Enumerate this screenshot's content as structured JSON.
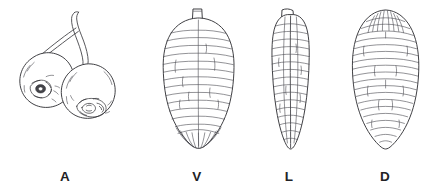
{
  "figure": {
    "type": "scientific-line-drawing-plate",
    "background_color": "#ffffff",
    "ink_color": "#3a3a3e",
    "width": 438,
    "height": 192,
    "panel_count": 4
  },
  "panels": [
    {
      "key": "A",
      "label": "A",
      "subject": "two cherries on joined stems with scale insect encrustations",
      "view": "habitus / host damage",
      "label_x": 65,
      "label_y": 180
    },
    {
      "key": "V",
      "label": "V",
      "subject": "scale insect body",
      "view": "ventral",
      "label_x": 197,
      "label_y": 180
    },
    {
      "key": "L",
      "label": "L",
      "subject": "scale insect body",
      "view": "lateral",
      "label_x": 289,
      "label_y": 180
    },
    {
      "key": "D",
      "label": "D",
      "subject": "scale insect body",
      "view": "dorsal",
      "label_x": 385,
      "label_y": 180
    }
  ],
  "labels": {
    "a": "A",
    "v": "V",
    "l": "L",
    "d": "D"
  }
}
